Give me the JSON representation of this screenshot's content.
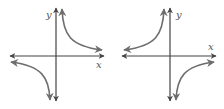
{
  "graphs": [
    {
      "name": "hyperbola-quadrants-1-3",
      "x_label": "x",
      "y_label": "y",
      "function": "y = 1/x"
    },
    {
      "name": "hyperbola-quadrants-2-4",
      "x_label": "x",
      "y_label": "y",
      "function": "y = -1/x"
    }
  ],
  "colors": {
    "axis": "#444444",
    "curve": "#6e6e6e"
  }
}
